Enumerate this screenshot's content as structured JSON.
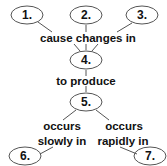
{
  "diagram": {
    "nodes": [
      {
        "id": "1",
        "label": "1."
      },
      {
        "id": "2",
        "label": "2."
      },
      {
        "id": "3",
        "label": "3."
      },
      {
        "id": "4",
        "label": "4."
      },
      {
        "id": "5",
        "label": "5."
      },
      {
        "id": "6",
        "label": "6."
      },
      {
        "id": "7",
        "label": "7."
      }
    ],
    "links": {
      "cause_changes_in": "cause changes in",
      "to_produce": "to produce",
      "occurs_slowly_line1": "occurs",
      "occurs_slowly_line2": "slowly in",
      "occurs_rapidly_line1": "occurs",
      "occurs_rapidly_line2": "rapidly in"
    },
    "edges": [
      {
        "from": "1",
        "to": "4",
        "label": "cause changes in"
      },
      {
        "from": "2",
        "to": "4",
        "label": "cause changes in"
      },
      {
        "from": "3",
        "to": "4",
        "label": "cause changes in"
      },
      {
        "from": "4",
        "to": "5",
        "label": "to produce"
      },
      {
        "from": "5",
        "to": "6",
        "label": "occurs slowly in"
      },
      {
        "from": "5",
        "to": "7",
        "label": "occurs rapidly in"
      }
    ]
  }
}
